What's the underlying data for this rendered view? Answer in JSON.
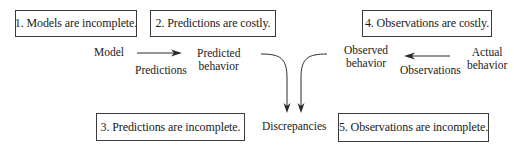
{
  "boxes": {
    "box1": "1. Models are incomplete.",
    "box2": "2. Predictions are costly.",
    "box3": "3. Predictions are incomplete.",
    "box4": "4. Observations are costly.",
    "box5": "5. Observations are incomplete."
  },
  "nodes": {
    "model": "Model",
    "predicted_line1": "Predicted",
    "predicted_line2": "behavior",
    "observed_line1": "Observed",
    "observed_line2": "behavior",
    "actual_line1": "Actual",
    "actual_line2": "behavior",
    "discrepancies": "Discrepancies"
  },
  "edges": {
    "predictions": "Predictions",
    "observations": "Observations"
  },
  "colors": {
    "stroke": "#2a2a2a",
    "text": "#1a1a1a"
  }
}
